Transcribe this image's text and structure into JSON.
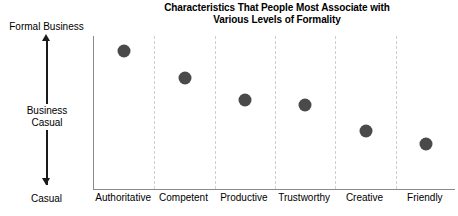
{
  "chart_data": {
    "type": "scatter",
    "title": "Characteristics That People Most Associate with Various Levels of Formality",
    "title_lines": [
      "Characteristics That People Most Associate with",
      "Various Levels of Formality"
    ],
    "xlabel": "",
    "ylabel": "",
    "categories": [
      "Authoritative",
      "Competent",
      "Productive",
      "Trustworthy",
      "Creative",
      "Friendly"
    ],
    "values": [
      2.8,
      2.46,
      2.17,
      2.1,
      1.76,
      1.6
    ],
    "ylim": [
      1,
      3
    ],
    "y_tick_labels": [
      "Formal Business",
      "Business Casual",
      "Casual"
    ],
    "y_tick_values": [
      3,
      2,
      1
    ],
    "grid": "vertical-dashed",
    "legend": "none",
    "series": [
      {
        "name": "Level of Formality",
        "marker": "filled-circle",
        "color": "#4a4a4a",
        "points": [
          {
            "category": "Authoritative",
            "value": 2.8
          },
          {
            "category": "Competent",
            "value": 2.46
          },
          {
            "category": "Productive",
            "value": 2.17
          },
          {
            "category": "Trustworthy",
            "value": 2.1
          },
          {
            "category": "Creative",
            "value": 1.76
          },
          {
            "category": "Friendly",
            "value": 1.6
          }
        ]
      }
    ]
  },
  "axis": {
    "y_top_label": "Formal Business",
    "y_middle_label": "Business Casual",
    "y_middle_label_lines": [
      "Business",
      "Casual"
    ],
    "y_bottom_label": "Casual"
  },
  "colors": {
    "marker": "#4a4a4a",
    "axis_line": "#8a8a8a",
    "gridline": "#cfcfcf",
    "arrow": "#1a1a1a",
    "text": "#000000",
    "background": "#ffffff"
  }
}
